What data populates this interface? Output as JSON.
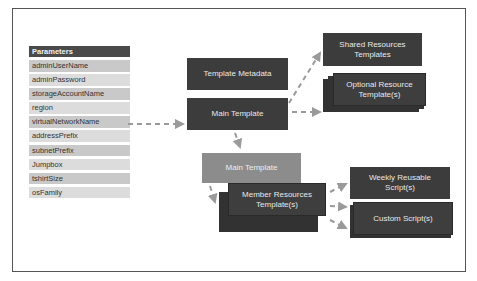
{
  "parameters": {
    "header": "Parameters",
    "items": [
      "adminUserName",
      "adminPassword",
      "storageAccountName",
      "region",
      "virtualNetworkName",
      "addressPrefix",
      "subnetPrefix",
      "Jumpbox",
      "tshirtSize",
      "osFamily"
    ]
  },
  "nodes": {
    "template_metadata": "Template Metadata",
    "main_template": "Main Template",
    "shared_resources": "Shared Resources Templates",
    "optional_resource": "Optional Resource Template(s)",
    "main_template_member": "Main Template",
    "member_resources": "Member Resources Template(s)",
    "weekly_reusable": "Weekly Reusable Script(s)",
    "custom_script": "Custom Script(s)"
  },
  "colors": {
    "dark_box": "#3c3c3c",
    "light_box": "#8c8c8c",
    "param_header": "#4a4a4a",
    "param_row_a": "#c9c9c9",
    "param_row_b": "#dcdcdc",
    "arrow": "#9a9a9a"
  }
}
